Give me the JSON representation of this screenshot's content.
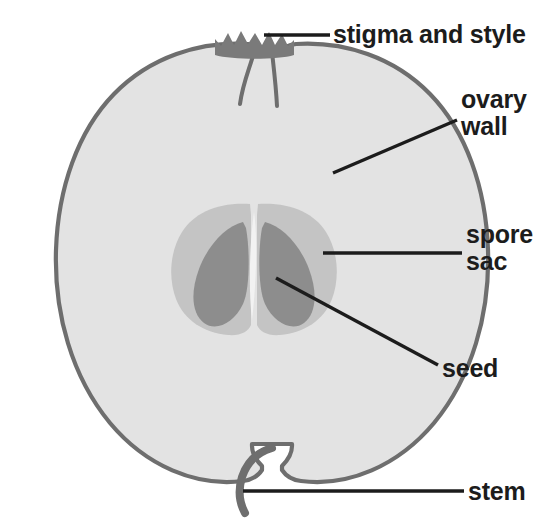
{
  "diagram": {
    "background_color": "#ffffff"
  },
  "labels": {
    "stigma_and_style": "stigma and style",
    "ovary_wall": "ovary\nwall",
    "spore_sac": "spore\nsac",
    "seed": "seed",
    "stem": "stem"
  },
  "colors": {
    "flesh_fill": "#e3e3e3",
    "outline_stroke": "#6e6e6e",
    "spore_sac_fill": "#c4c4c4",
    "seed_fill": "#8d8d8d",
    "stigma_fill": "#7a7a7a",
    "leader_line": "#1c1c1c",
    "text": "#1c1c1c"
  },
  "parts": [
    {
      "name": "ovary-wall",
      "description": "outer fleshy body of the fruit"
    },
    {
      "name": "spore-sac",
      "description": "light grey core region surrounding the seeds"
    },
    {
      "name": "seed",
      "description": "two dark teardrop seeds inside the core"
    },
    {
      "name": "stigma-and-style",
      "description": "dark crown at the apex with two style channels"
    },
    {
      "name": "stem",
      "description": "curved hook at the base of the fruit"
    }
  ]
}
